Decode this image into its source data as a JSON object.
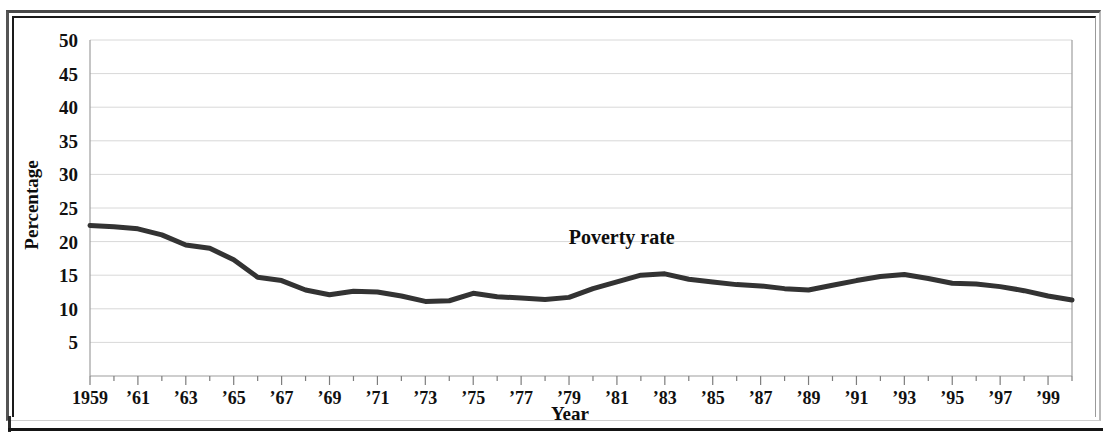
{
  "figure": {
    "frame_style": "double-rule-box",
    "background_color": "#ffffff",
    "ink_color": "#333333"
  },
  "chart_data": {
    "type": "line",
    "title": "",
    "subtitle": "",
    "xlabel": "Year",
    "ylabel": "Percentage",
    "grid": true,
    "legend_position": "inline-annotation",
    "xlim": [
      1959,
      2000
    ],
    "ylim": [
      0,
      50
    ],
    "ytick_labels": [
      "50",
      "45",
      "40",
      "35",
      "30",
      "25",
      "20",
      "15",
      "10",
      "5"
    ],
    "ytick_values": [
      50,
      45,
      40,
      35,
      30,
      25,
      20,
      15,
      10,
      5
    ],
    "xtick_labels": [
      "1959",
      "’61",
      "’63",
      "’65",
      "’67",
      "’69",
      "’71",
      "’73",
      "’75",
      "’77",
      "’79",
      "’81",
      "’83",
      "’85",
      "’87",
      "’89",
      "’91",
      "’93",
      "’95",
      "’97",
      "’99"
    ],
    "xtick_values": [
      1959,
      1961,
      1963,
      1965,
      1967,
      1969,
      1971,
      1973,
      1975,
      1977,
      1979,
      1981,
      1983,
      1985,
      1987,
      1989,
      1991,
      1993,
      1995,
      1997,
      1999
    ],
    "annotations": [
      {
        "text": "Poverty rate",
        "x": 1981.2,
        "y": 19.6
      }
    ],
    "series": [
      {
        "name": "Poverty rate",
        "color": "#333333",
        "x": [
          1959,
          1960,
          1961,
          1962,
          1963,
          1964,
          1965,
          1966,
          1967,
          1968,
          1969,
          1970,
          1971,
          1972,
          1973,
          1974,
          1975,
          1976,
          1977,
          1978,
          1979,
          1980,
          1981,
          1982,
          1983,
          1984,
          1985,
          1986,
          1987,
          1988,
          1989,
          1990,
          1991,
          1992,
          1993,
          1994,
          1995,
          1996,
          1997,
          1998,
          1999,
          2000
        ],
        "values": [
          22.4,
          22.2,
          21.9,
          21.0,
          19.5,
          19.0,
          17.3,
          14.7,
          14.2,
          12.8,
          12.1,
          12.6,
          12.5,
          11.9,
          11.1,
          11.2,
          12.3,
          11.8,
          11.6,
          11.4,
          11.7,
          13.0,
          14.0,
          15.0,
          15.2,
          14.4,
          14.0,
          13.6,
          13.4,
          13.0,
          12.8,
          13.5,
          14.2,
          14.8,
          15.1,
          14.5,
          13.8,
          13.7,
          13.3,
          12.7,
          11.9,
          11.3
        ]
      }
    ]
  }
}
